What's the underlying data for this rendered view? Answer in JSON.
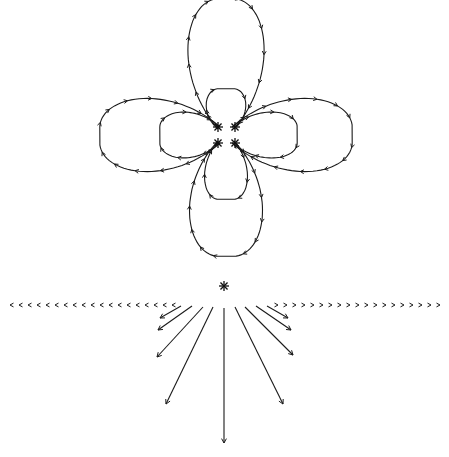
{
  "diagram": {
    "colors": {
      "background": "#ffffff",
      "ink": "#1a1a1a"
    },
    "top_figure": {
      "charges": [
        {
          "x": 218,
          "y": 127
        },
        {
          "x": 235,
          "y": 127
        },
        {
          "x": 218,
          "y": 143
        },
        {
          "x": 235,
          "y": 143
        }
      ],
      "center": {
        "x": 226,
        "y": 135
      },
      "lobes": [
        {
          "name": "top-outer",
          "dir": "up",
          "length": 130,
          "width": 40
        },
        {
          "name": "bottom-outer",
          "dir": "down",
          "length": 115,
          "width": 38
        },
        {
          "name": "left-outer",
          "dir": "left",
          "length": 120,
          "width": 38
        },
        {
          "name": "right-outer",
          "dir": "right",
          "length": 120,
          "width": 38
        },
        {
          "name": "top-inner",
          "dir": "up",
          "length": 40,
          "width": 16
        },
        {
          "name": "bottom-inner",
          "dir": "down",
          "length": 58,
          "width": 18
        },
        {
          "name": "left-inner",
          "dir": "left",
          "length": 60,
          "width": 20
        },
        {
          "name": "right-inner",
          "dir": "right",
          "length": 65,
          "width": 20
        }
      ]
    },
    "bottom_figure": {
      "charge": {
        "x": 224,
        "y": 286
      },
      "baseline_y": 305,
      "baseline_left_chevrons": 19,
      "baseline_right_chevrons": 19,
      "rays": [
        {
          "x1": 224,
          "y1": 308,
          "x2": 224,
          "y2": 443
        },
        {
          "x1": 213,
          "y1": 307,
          "x2": 166,
          "y2": 404
        },
        {
          "x1": 235,
          "y1": 307,
          "x2": 283,
          "y2": 404
        },
        {
          "x1": 203,
          "y1": 307,
          "x2": 157,
          "y2": 357
        },
        {
          "x1": 245,
          "y1": 307,
          "x2": 293,
          "y2": 355
        },
        {
          "x1": 192,
          "y1": 306,
          "x2": 158,
          "y2": 330
        },
        {
          "x1": 256,
          "y1": 306,
          "x2": 291,
          "y2": 330
        },
        {
          "x1": 181,
          "y1": 306,
          "x2": 160,
          "y2": 318
        },
        {
          "x1": 267,
          "y1": 306,
          "x2": 288,
          "y2": 318
        }
      ]
    }
  }
}
